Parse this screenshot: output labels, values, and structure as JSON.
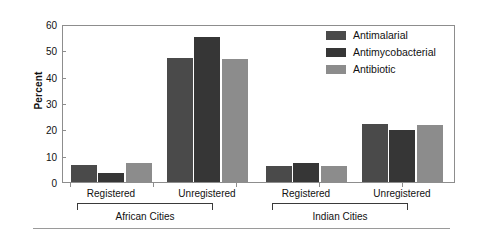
{
  "chart_data": {
    "type": "bar",
    "title": "",
    "xlabel": "",
    "ylabel": "Percent",
    "ylim": [
      0,
      60
    ],
    "yticks": [
      0,
      10,
      20,
      30,
      40,
      50,
      60
    ],
    "grid": false,
    "legend_position": "top-right",
    "categories": [
      "Registered",
      "Unregistered",
      "Registered",
      "Unregistered"
    ],
    "groups": [
      {
        "name": "African Cities",
        "categories": [
          "Registered",
          "Unregistered"
        ]
      },
      {
        "name": "Indian Cities",
        "categories": [
          "Registered",
          "Unregistered"
        ]
      }
    ],
    "series": [
      {
        "name": "Antimalarial",
        "color": "#4a4a4a",
        "values": [
          6.7,
          47.7,
          6.2,
          22.2
        ]
      },
      {
        "name": "Antimycobacterial",
        "color": "#363636",
        "values": [
          3.4,
          55.7,
          7.2,
          20.1
        ]
      },
      {
        "name": "Antibiotic",
        "color": "#8c8c8c",
        "values": [
          7.3,
          47.5,
          6.1,
          22.0
        ]
      }
    ]
  },
  "axis": {
    "y_title": "Percent",
    "y_tick_labels": [
      "0",
      "10",
      "20",
      "30",
      "40",
      "50",
      "60"
    ],
    "x_tick_labels": [
      "Registered",
      "Unregistered",
      "Registered",
      "Unregistered"
    ]
  },
  "legend": {
    "items": [
      {
        "label": "Antimalarial",
        "color": "#4a4a4a"
      },
      {
        "label": "Antimycobacterial",
        "color": "#363636"
      },
      {
        "label": "Antibiotic",
        "color": "#8c8c8c"
      }
    ]
  },
  "group_labels": [
    "African Cities",
    "Indian Cities"
  ]
}
